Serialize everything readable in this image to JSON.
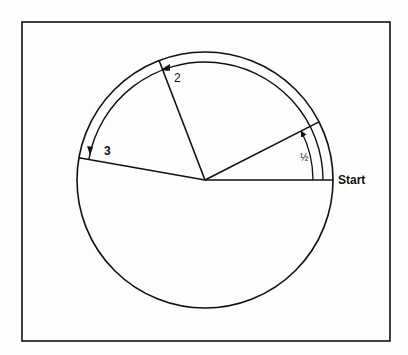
{
  "diagram": {
    "labels": {
      "start": "Start",
      "step1": "½",
      "step2": "2",
      "step3": "3"
    },
    "geometry": {
      "center": [
        205,
        180
      ],
      "outer_radius": 128,
      "band_radius": 118,
      "inner_arrow_radius": 108,
      "frame": {
        "x": 22,
        "y": 22,
        "width": 368,
        "height": 319
      },
      "radii_angles_deg": {
        "start": 0,
        "line1": 27,
        "line2": 111,
        "line3": 170
      }
    },
    "colors": {
      "stroke": "#111111",
      "background": "#fdfdfd"
    }
  }
}
